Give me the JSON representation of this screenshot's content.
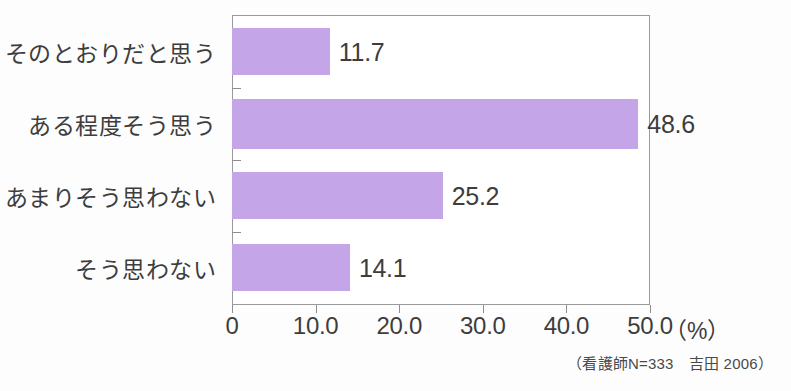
{
  "chart_data": {
    "type": "bar",
    "orientation": "horizontal",
    "title": "",
    "xlabel": "",
    "ylabel": "",
    "unit_label": "（%）",
    "categories": [
      "そのとおりだと思う",
      "ある程度そう思う",
      "あまりそう思わない",
      "そう思わない"
    ],
    "values": [
      11.7,
      48.6,
      25.2,
      14.1
    ],
    "value_labels": [
      "11.7",
      "48.6",
      "25.2",
      "14.1"
    ],
    "xlim": [
      0,
      50
    ],
    "xticks": [
      0,
      10,
      20,
      30,
      40,
      50
    ],
    "xtick_labels": [
      "0",
      "10.0",
      "20.0",
      "30.0",
      "40.0",
      "50.0"
    ],
    "grid": false,
    "legend": false,
    "bar_color": "#c4a5e8",
    "axis_color": "#9a9a9a",
    "text_color": "#3d3d3d",
    "source_note": "（看護師N=333　吉田 2006）"
  }
}
